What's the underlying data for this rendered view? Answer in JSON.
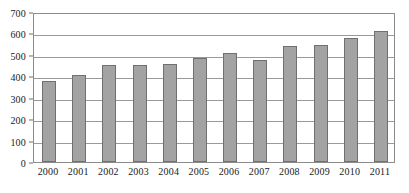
{
  "chart_data": {
    "type": "bar",
    "title": "",
    "subtitle": "",
    "xlabel": "",
    "ylabel": "",
    "categories": [
      "2000",
      "2001",
      "2002",
      "2003",
      "2004",
      "2005",
      "2006",
      "2007",
      "2008",
      "2009",
      "2010",
      "2011"
    ],
    "values": [
      378,
      405,
      455,
      455,
      458,
      487,
      508,
      478,
      540,
      545,
      578,
      612
    ],
    "series": [
      {
        "name": "",
        "values": [
          378,
          405,
          455,
          455,
          458,
          487,
          508,
          478,
          540,
          545,
          578,
          612
        ]
      }
    ],
    "ylim": [
      0,
      700
    ],
    "y_ticks": [
      0,
      100,
      200,
      300,
      400,
      500,
      600,
      700
    ],
    "y_tick_labels": [
      "0",
      "100",
      "200",
      "300",
      "400",
      "500",
      "600",
      "700"
    ],
    "grid": true,
    "grid_axis": "y",
    "legend": false,
    "legend_position": "none",
    "bar_color": "#a3a3a3",
    "bar_border_color": "#707070",
    "grid_color": "#9a9a9a",
    "frame_color": "#8c8c8c",
    "background_color": "#ffffff",
    "text_color": "#1a1a1a",
    "annotations": []
  }
}
